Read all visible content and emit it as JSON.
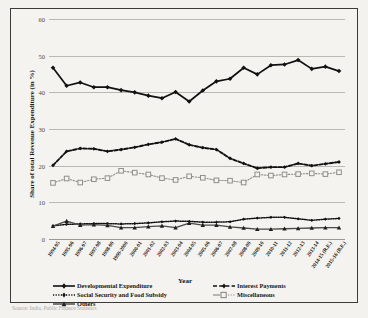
{
  "figure": {
    "caption": "Source: India, Public Finance Statistics"
  },
  "axes": {
    "y_title": "Share of total Revenue Expenditure (in %)",
    "x_title": "Year",
    "y_ticks": [
      0,
      10,
      20,
      30,
      40,
      50,
      60
    ]
  },
  "legend": {
    "items": [
      {
        "label": "Developmental Expenditure",
        "style": "solid-diamond",
        "color": "#111111"
      },
      {
        "label": "Interest Payments",
        "style": "dashed-thick",
        "color": "#111111"
      },
      {
        "label": "Social Security and Food Subsidy",
        "style": "dotted",
        "color": "#111111"
      },
      {
        "label": "Miscellaneous",
        "style": "solid-square-open",
        "color": "#8c8c88"
      },
      {
        "label": "Others",
        "style": "solid-triangle",
        "color": "#444444"
      }
    ]
  },
  "chart_data": {
    "type": "line",
    "title": "",
    "xlabel": "Year",
    "ylabel": "Share of total Revenue Expenditure (in %)",
    "ylim": [
      0,
      60
    ],
    "grid": true,
    "legend_position": "bottom",
    "categories": [
      "1994-95",
      "1995-96",
      "1996-97",
      "1997-98",
      "1998-99",
      "1999-2000",
      "2000-01",
      "2001-02",
      "2002-03",
      "2003-04",
      "2004-05",
      "2005-06",
      "2006-07",
      "2007-08",
      "2008-09",
      "2009-10",
      "2010-11",
      "2011-12",
      "2012-13",
      "2013-14",
      "2014-15 (R.E.)",
      "2015-16 (B.E.)"
    ],
    "series": [
      {
        "name": "Developmental Expenditure",
        "values": [
          46.7,
          41.8,
          42.7,
          41.4,
          41.4,
          40.6,
          40.0,
          39.1,
          38.4,
          40.1,
          37.5,
          40.5,
          43.0,
          43.7,
          46.7,
          44.9,
          47.4,
          47.6,
          48.8,
          46.4,
          47.0,
          45.8
        ]
      },
      {
        "name": "Interest Payments",
        "values": [
          20.1,
          23.9,
          24.7,
          24.6,
          23.9,
          24.4,
          25.0,
          25.8,
          26.4,
          27.3,
          25.7,
          24.9,
          24.4,
          22.0,
          20.6,
          19.3,
          19.6,
          19.6,
          20.6,
          20.0,
          20.5,
          21.0
        ]
      },
      {
        "name": "Social Security and Food Subsidy",
        "values": [
          3.6,
          4.0,
          4.1,
          4.2,
          4.2,
          4.1,
          4.2,
          4.4,
          4.7,
          4.9,
          4.8,
          4.6,
          4.6,
          4.7,
          5.4,
          5.7,
          5.9,
          5.9,
          5.5,
          5.1,
          5.4,
          5.6
        ]
      },
      {
        "name": "Miscellaneous",
        "values": [
          15.3,
          16.5,
          15.4,
          16.3,
          16.6,
          18.6,
          18.1,
          17.6,
          16.6,
          16.1,
          17.1,
          16.7,
          16.0,
          15.9,
          15.4,
          17.6,
          17.3,
          17.6,
          17.7,
          17.9,
          17.7,
          18.2
        ]
      },
      {
        "name": "Others",
        "values": [
          3.5,
          4.9,
          3.8,
          3.9,
          3.7,
          3.1,
          3.1,
          3.4,
          3.6,
          3.1,
          4.3,
          3.8,
          3.8,
          3.3,
          3.0,
          2.7,
          2.7,
          2.8,
          2.9,
          3.0,
          3.1,
          3.1
        ]
      }
    ]
  }
}
